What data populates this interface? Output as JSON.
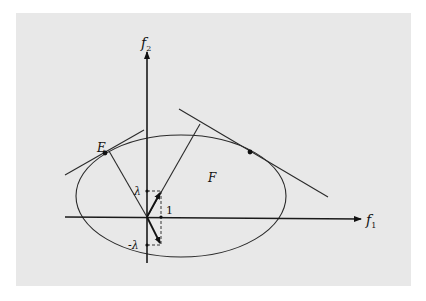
{
  "figure": {
    "background": "#e8e8e8",
    "ink": "#1a1a1a",
    "panel": {
      "x": 16,
      "y": 13,
      "w": 395,
      "h": 273
    }
  },
  "axes": {
    "f1": {
      "label": "f",
      "subscript": "1"
    },
    "f2": {
      "label": "f",
      "subscript": "2"
    }
  },
  "labels": {
    "E": "E",
    "F": "F",
    "lambda": "λ",
    "neg_lambda": "-λ",
    "one": "1"
  },
  "geometry": {
    "origin": [
      147,
      217
    ],
    "ellipse": {
      "cx": 181,
      "cy": 196,
      "rx": 105,
      "ry": 61
    },
    "tick_lambda": [
      147,
      191
    ],
    "tick_neg_lambda": [
      147,
      245
    ],
    "tick_one": [
      161,
      217
    ],
    "point_E": [
      105,
      153
    ],
    "point_right": [
      250,
      152
    ]
  }
}
